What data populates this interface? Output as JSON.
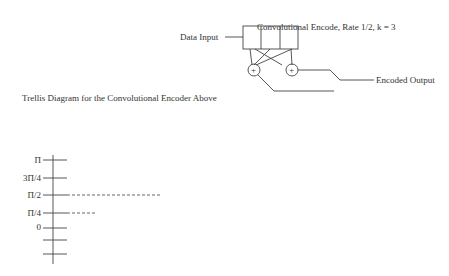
{
  "encoder": {
    "title": "Convolutional Encode, Rate 1/2, k = 3",
    "input_label": "Data Input",
    "output_label": "Encoded Output",
    "adder_symbol": "+"
  },
  "trellis": {
    "title": "Trellis Diagram for the Convolutional Encoder Above",
    "y_axis_ticks": [
      "Π",
      "3Π/4",
      "Π/2",
      "Π/4",
      "0",
      "−Π/4",
      "−Π/2",
      "−3Π/4",
      "−Π"
    ],
    "decisions": [
      {
        "label": "Decision",
        "value": "10"
      },
      {
        "label": "Decision",
        "value": "101"
      },
      {
        "label": "Decision",
        "value": "1000"
      }
    ],
    "stage1": [
      "1",
      "0"
    ],
    "stage2": [
      "11",
      "10",
      "01",
      "00"
    ],
    "stage3": [
      "111",
      "110",
      "101",
      "100",
      "001",
      "000"
    ],
    "stage4": [
      "1110",
      "1011",
      "1010",
      "1001",
      "1000",
      "0001"
    ],
    "stage5": [
      "1111",
      "1011",
      "1010",
      "1000",
      "0000"
    ]
  }
}
